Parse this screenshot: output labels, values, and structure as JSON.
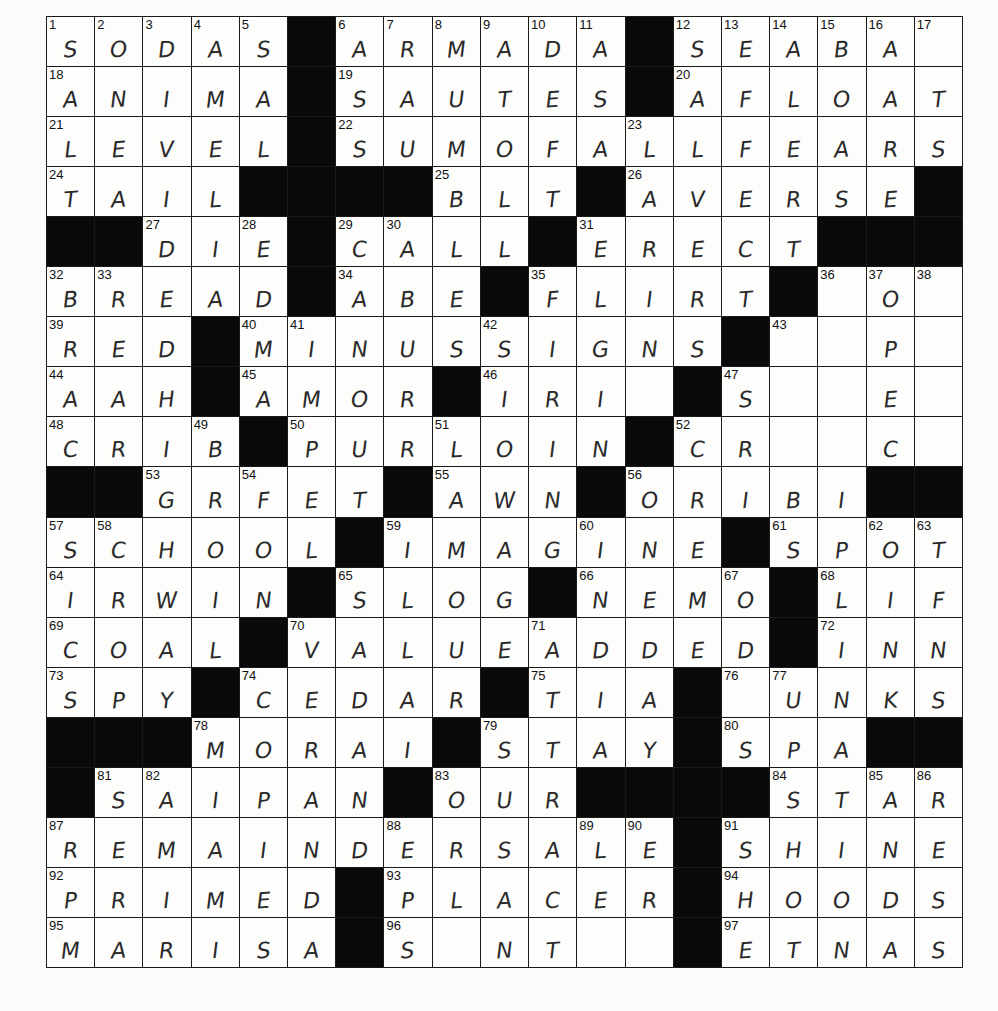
{
  "page": {
    "top_text": ""
  },
  "grid": {
    "rows": 19,
    "cols": 19,
    "colors": {
      "paper": "#fdfdfc",
      "black_square": "#0a0a0a",
      "ink": "#2a2a2a",
      "lines": "#1a1a1a"
    },
    "cells": [
      "SODAS#ARMADA#SEABA_",
      "ANIMA#SAUTES#AFLOAT",
      "LEVEL#SUMOFALLFEARS",
      "TAIL####BLT#AVERSE#",
      "##DIE#CALL#ERECT###",
      "BREAD#ABE#FLIRT#_O_",
      "RED#MINUSSIGNS#__P_",
      "AAH#AMOR#IRI_#S__E_",
      "CRIB#PURLOIN#CR__C_",
      "##GRFET#AWN#ORIBI##",
      "SCHOOL#IMAGINE#SPOT",
      "IRWIN#SLOG#NEMO#LIF",
      "COAL#VALUEADDED#INN",
      "SPY#CEDAR#TIA#_UNKS",
      "###MORAI#STAY#SPA##",
      "#SAIPAN#OUR####STAR",
      "REMAINDERSALE#SHINE",
      "PRIMED#PLACER#HOODS",
      "MARISA#S_NT__#ETNAS"
    ],
    "numbers": [
      [
        0,
        0,
        1
      ],
      [
        0,
        1,
        2
      ],
      [
        0,
        2,
        3
      ],
      [
        0,
        3,
        4
      ],
      [
        0,
        4,
        5
      ],
      [
        0,
        6,
        6
      ],
      [
        0,
        7,
        7
      ],
      [
        0,
        8,
        8
      ],
      [
        0,
        9,
        9
      ],
      [
        0,
        10,
        10
      ],
      [
        0,
        11,
        11
      ],
      [
        0,
        13,
        12
      ],
      [
        0,
        14,
        13
      ],
      [
        0,
        15,
        14
      ],
      [
        0,
        16,
        15
      ],
      [
        0,
        17,
        16
      ],
      [
        0,
        18,
        17
      ],
      [
        1,
        0,
        18
      ],
      [
        1,
        6,
        19
      ],
      [
        1,
        13,
        20
      ],
      [
        2,
        0,
        21
      ],
      [
        2,
        6,
        22
      ],
      [
        2,
        12,
        23
      ],
      [
        3,
        0,
        24
      ],
      [
        3,
        8,
        25
      ],
      [
        3,
        12,
        26
      ],
      [
        4,
        2,
        27
      ],
      [
        4,
        4,
        28
      ],
      [
        4,
        6,
        29
      ],
      [
        4,
        7,
        30
      ],
      [
        4,
        11,
        31
      ],
      [
        5,
        0,
        32
      ],
      [
        5,
        1,
        33
      ],
      [
        5,
        6,
        34
      ],
      [
        5,
        10,
        35
      ],
      [
        5,
        16,
        36
      ],
      [
        5,
        17,
        37
      ],
      [
        5,
        18,
        38
      ],
      [
        6,
        0,
        39
      ],
      [
        6,
        4,
        40
      ],
      [
        6,
        5,
        41
      ],
      [
        6,
        9,
        42
      ],
      [
        6,
        15,
        43
      ],
      [
        7,
        0,
        44
      ],
      [
        7,
        4,
        45
      ],
      [
        7,
        9,
        46
      ],
      [
        7,
        14,
        47
      ],
      [
        8,
        0,
        48
      ],
      [
        8,
        3,
        49
      ],
      [
        8,
        5,
        50
      ],
      [
        8,
        8,
        51
      ],
      [
        8,
        13,
        52
      ],
      [
        9,
        2,
        53
      ],
      [
        9,
        4,
        54
      ],
      [
        9,
        8,
        55
      ],
      [
        9,
        12,
        56
      ],
      [
        10,
        0,
        57
      ],
      [
        10,
        1,
        58
      ],
      [
        10,
        7,
        59
      ],
      [
        10,
        11,
        60
      ],
      [
        10,
        15,
        61
      ],
      [
        10,
        17,
        62
      ],
      [
        10,
        18,
        63
      ],
      [
        11,
        0,
        64
      ],
      [
        11,
        6,
        65
      ],
      [
        11,
        11,
        66
      ],
      [
        11,
        14,
        67
      ],
      [
        11,
        16,
        68
      ],
      [
        12,
        0,
        69
      ],
      [
        12,
        5,
        70
      ],
      [
        12,
        10,
        71
      ],
      [
        12,
        16,
        72
      ],
      [
        13,
        0,
        73
      ],
      [
        13,
        4,
        74
      ],
      [
        13,
        10,
        75
      ],
      [
        13,
        14,
        76
      ],
      [
        13,
        15,
        77
      ],
      [
        14,
        3,
        78
      ],
      [
        14,
        9,
        79
      ],
      [
        14,
        14,
        80
      ],
      [
        15,
        1,
        81
      ],
      [
        15,
        2,
        82
      ],
      [
        15,
        8,
        83
      ],
      [
        15,
        15,
        84
      ],
      [
        15,
        17,
        85
      ],
      [
        15,
        18,
        86
      ],
      [
        16,
        0,
        87
      ],
      [
        16,
        7,
        88
      ],
      [
        16,
        11,
        89
      ],
      [
        16,
        12,
        90
      ],
      [
        16,
        14,
        91
      ],
      [
        17,
        0,
        92
      ],
      [
        17,
        7,
        93
      ],
      [
        17,
        14,
        94
      ],
      [
        18,
        0,
        95
      ],
      [
        18,
        7,
        96
      ],
      [
        18,
        14,
        97
      ]
    ]
  }
}
